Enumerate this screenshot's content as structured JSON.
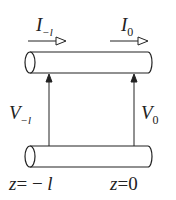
{
  "diagram": {
    "type": "transmission-line-section",
    "labels": {
      "current_left": {
        "symbol": "I",
        "subscript": "−l"
      },
      "current_right": {
        "symbol": "I",
        "subscript": "0"
      },
      "voltage_left": {
        "symbol": "V",
        "subscript": "−l"
      },
      "voltage_right": {
        "symbol": "V",
        "subscript": "0"
      },
      "position_left": {
        "var": "z",
        "eq": "=",
        "value": "−",
        "value_var": "l"
      },
      "position_right": {
        "var": "z",
        "eq": "=",
        "value": "0"
      }
    },
    "colors": {
      "stroke": "#222222",
      "background": "#ffffff"
    }
  }
}
